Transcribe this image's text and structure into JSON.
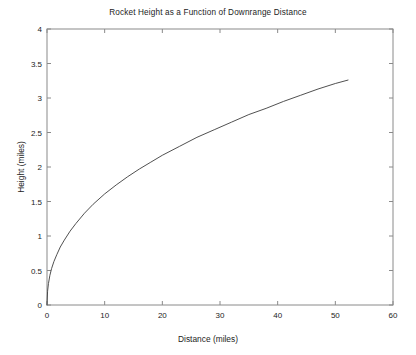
{
  "chart_data": {
    "type": "line",
    "title": "Rocket Height as a Function of Downrange Distance",
    "xlabel": "Distance (miles)",
    "ylabel": "Height (miles)",
    "xlim": [
      0,
      60
    ],
    "ylim": [
      0,
      4
    ],
    "xticks": [
      "0",
      "10",
      "20",
      "30",
      "40",
      "50",
      "60"
    ],
    "xtick_values": [
      0,
      10,
      20,
      30,
      40,
      50,
      60
    ],
    "yticks": [
      "0",
      "0.5",
      "1",
      "1.5",
      "2",
      "2.5",
      "3",
      "3.5",
      "4"
    ],
    "ytick_values": [
      0,
      0.5,
      1,
      1.5,
      2,
      2.5,
      3,
      3.5,
      4
    ],
    "grid": false,
    "legend": false,
    "line_color": "#3c3c3c",
    "axis_color": "#808080",
    "background": "#ffffff",
    "series": [
      {
        "name": "Rocket trajectory",
        "x": [
          0,
          0.1,
          0.25,
          0.5,
          0.8,
          1.2,
          1.7,
          2.3,
          3,
          4,
          5,
          6.5,
          8,
          10,
          12,
          14,
          16,
          18,
          20,
          23,
          26,
          29,
          32,
          35,
          38,
          41,
          44,
          47,
          50,
          52.2
        ],
        "y": [
          0,
          0.2,
          0.31,
          0.43,
          0.53,
          0.63,
          0.73,
          0.84,
          0.94,
          1.07,
          1.18,
          1.33,
          1.46,
          1.61,
          1.74,
          1.86,
          1.97,
          2.07,
          2.17,
          2.3,
          2.43,
          2.54,
          2.65,
          2.76,
          2.85,
          2.95,
          3.04,
          3.13,
          3.21,
          3.26
        ]
      }
    ]
  }
}
